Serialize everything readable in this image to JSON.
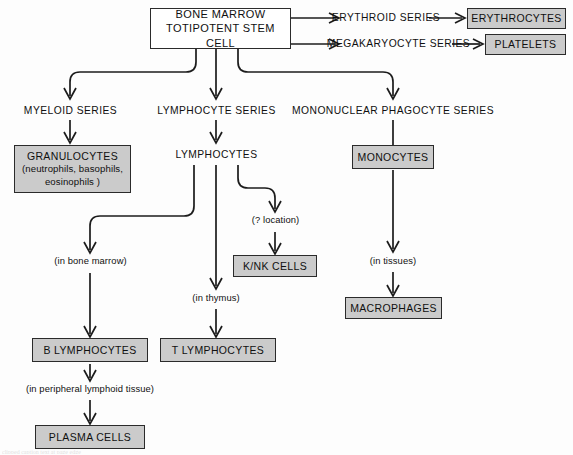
{
  "diagram": {
    "colors": {
      "shaded_box_fill": "#cbcbcb",
      "plain_box_fill": "#ffffff",
      "stroke": "#2b2b2b",
      "text": "#101010",
      "background": "#fdfdfd"
    },
    "nodes": {
      "stem_cell_line1": "BONE MARROW",
      "stem_cell_line2": "TOTIPOTENT STEM CELL",
      "erythroid_series": "ERYTHROID SERIES",
      "erythrocytes": "ERYTHROCYTES",
      "megakaryocyte_series": "MEGAKARYOCYTE SERIES",
      "platelets": "PLATELETS",
      "myeloid_series": "MYELOID SERIES",
      "granulocytes_title": "GRANULOCYTES",
      "granulocytes_sub1": "(neutrophils, basophils,",
      "granulocytes_sub2": "eosinophils )",
      "lymphocyte_series": "LYMPHOCYTE SERIES",
      "lymphocytes": "LYMPHOCYTES",
      "mononuclear_phagocyte_series": "MONONUCLEAR PHAGOCYTE SERIES",
      "monocytes": "MONOCYTES",
      "macrophages": "MACROPHAGES",
      "k_nk_cells": "K/NK CELLS",
      "b_lymphocytes": "B LYMPHOCYTES",
      "t_lymphocytes": "T LYMPHOCYTES",
      "plasma_cells": "PLASMA CELLS"
    },
    "annotations": {
      "question_location": "(? location)",
      "in_bone_marrow": "(in bone marrow)",
      "in_thymus": "(in thymus)",
      "in_tissues": "(in tissues)",
      "in_peripheral_lymphoid_tissue": "(in peripheral lymphoid tissue)"
    },
    "footer": {
      "cropped_caption": "clipped caption text at page edge"
    }
  }
}
